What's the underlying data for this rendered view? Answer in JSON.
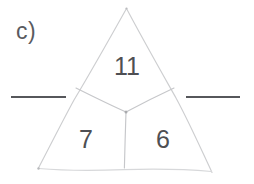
{
  "page": {
    "width": 254,
    "height": 184,
    "background_color": "#ffffff",
    "ink_color": "#4e4f53",
    "faint_ink_color": "#cfd0d2"
  },
  "exercise": {
    "item_label": "c)",
    "type": "number-triangle-puzzle"
  },
  "triangle": {
    "apex": [
      126,
      8
    ],
    "bottom_left": [
      38,
      168
    ],
    "bottom_right": [
      212,
      172
    ],
    "junction": [
      126,
      112
    ],
    "left_branch_end": [
      76,
      88
    ],
    "right_branch_end": [
      174,
      88
    ],
    "stem_end": [
      124,
      168
    ]
  },
  "cells": [
    {
      "name": "top",
      "value": "11",
      "x": 127,
      "y": 66
    },
    {
      "name": "bottom-left",
      "value": "7",
      "x": 86,
      "y": 139
    },
    {
      "name": "bottom-right",
      "value": "6",
      "x": 163,
      "y": 139
    }
  ],
  "answer_blanks": [
    {
      "name": "left",
      "x1": 11,
      "x2": 66,
      "y": 97
    },
    {
      "name": "right",
      "x1": 186,
      "x2": 240,
      "y": 97
    }
  ]
}
